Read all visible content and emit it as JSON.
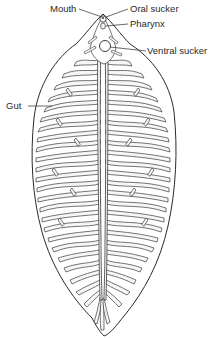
{
  "figure": {
    "labels": {
      "mouth": "Mouth",
      "oral_sucker": "Oral  sucker",
      "pharynx": "Pharynx",
      "ventral_sucker": "Ventral  sucker",
      "gut": "Gut"
    },
    "colors": {
      "ink": "#2a2a2a",
      "background": "#ffffff",
      "stipple": "#9a9a9a"
    }
  }
}
